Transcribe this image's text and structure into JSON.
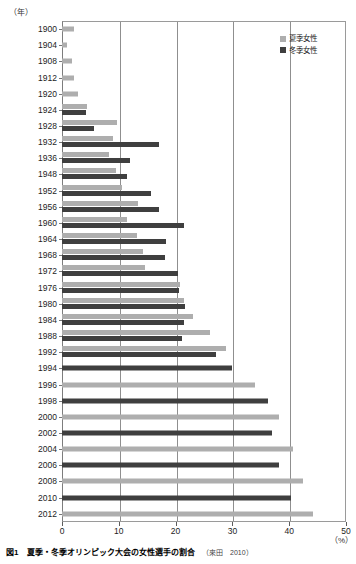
{
  "figure": {
    "caption_number": "図1",
    "caption_title": "夏季・冬季オリンピック大会の女性選手の割合",
    "caption_source": "（來田　2010）"
  },
  "axes": {
    "y_unit_label": "（年）",
    "x_unit_label": "（%）",
    "x_ticks": [
      "0",
      "10",
      "20",
      "30",
      "40",
      "50"
    ]
  },
  "legend": {
    "items": [
      {
        "label": "夏季女性",
        "color": "#aeaeae",
        "key": "summer"
      },
      {
        "label": "冬季女性",
        "color": "#3f3f3f",
        "key": "winter"
      }
    ]
  },
  "colors": {
    "summer": "#aeaeae",
    "winter": "#3f3f3f",
    "frame": "#9a9a9a",
    "grid": "#8f8f8f"
  },
  "chart_data": {
    "type": "bar",
    "orientation": "horizontal",
    "title": "夏季・冬季オリンピック大会の女性選手の割合",
    "xlabel": "（%）",
    "ylabel": "（年）",
    "xlim": [
      0,
      50
    ],
    "grid": true,
    "legend_position": "top-right",
    "categories": [
      "1900",
      "1904",
      "1908",
      "1912",
      "1920",
      "1924",
      "1928",
      "1932",
      "1936",
      "1948",
      "1952",
      "1956",
      "1960",
      "1964",
      "1968",
      "1972",
      "1976",
      "1980",
      "1984",
      "1988",
      "1992",
      "1994",
      "1996",
      "1998",
      "2000",
      "2002",
      "2004",
      "2006",
      "2008",
      "2010",
      "2012"
    ],
    "series": [
      {
        "name": "夏季女性",
        "color": "#aeaeae",
        "values": [
          2.2,
          0.9,
          1.8,
          2.2,
          2.9,
          4.4,
          9.6,
          9.0,
          8.3,
          9.5,
          10.5,
          13.3,
          11.4,
          13.2,
          14.2,
          14.6,
          20.7,
          21.5,
          23.0,
          26.1,
          28.9,
          null,
          34.0,
          null,
          38.2,
          null,
          40.7,
          null,
          42.4,
          null,
          44.2
        ]
      },
      {
        "name": "冬季女性",
        "color": "#3f3f3f",
        "values": [
          null,
          null,
          null,
          null,
          null,
          4.3,
          5.6,
          17.0,
          12.0,
          11.5,
          15.7,
          17.0,
          21.5,
          18.3,
          18.2,
          20.5,
          20.6,
          21.7,
          21.5,
          21.2,
          27.1,
          30.0,
          null,
          36.2,
          null,
          36.9,
          null,
          38.2,
          null,
          40.3,
          null
        ]
      }
    ]
  },
  "rows": [
    {
      "year": "1900",
      "summer": 2.2,
      "winter": null
    },
    {
      "year": "1904",
      "summer": 0.9,
      "winter": null
    },
    {
      "year": "1908",
      "summer": 1.8,
      "winter": null
    },
    {
      "year": "1912",
      "summer": 2.2,
      "winter": null
    },
    {
      "year": "1920",
      "summer": 2.9,
      "winter": null
    },
    {
      "year": "1924",
      "summer": 4.4,
      "winter": 4.3
    },
    {
      "year": "1928",
      "summer": 9.6,
      "winter": 5.6
    },
    {
      "year": "1932",
      "summer": 9.0,
      "winter": 17.0
    },
    {
      "year": "1936",
      "summer": 8.3,
      "winter": 12.0
    },
    {
      "year": "1948",
      "summer": 9.5,
      "winter": 11.5
    },
    {
      "year": "1952",
      "summer": 10.5,
      "winter": 15.7
    },
    {
      "year": "1956",
      "summer": 13.3,
      "winter": 17.0
    },
    {
      "year": "1960",
      "summer": 11.4,
      "winter": 21.5
    },
    {
      "year": "1964",
      "summer": 13.2,
      "winter": 18.3
    },
    {
      "year": "1968",
      "summer": 14.2,
      "winter": 18.2
    },
    {
      "year": "1972",
      "summer": 14.6,
      "winter": 20.5
    },
    {
      "year": "1976",
      "summer": 20.7,
      "winter": 20.6
    },
    {
      "year": "1980",
      "summer": 21.5,
      "winter": 21.7
    },
    {
      "year": "1984",
      "summer": 23.0,
      "winter": 21.5
    },
    {
      "year": "1988",
      "summer": 26.1,
      "winter": 21.2
    },
    {
      "year": "1992",
      "summer": 28.9,
      "winter": 27.1
    },
    {
      "year": "1994",
      "summer": null,
      "winter": 30.0
    },
    {
      "year": "1996",
      "summer": 34.0,
      "winter": null
    },
    {
      "year": "1998",
      "summer": null,
      "winter": 36.2
    },
    {
      "year": "2000",
      "summer": 38.2,
      "winter": null
    },
    {
      "year": "2002",
      "summer": null,
      "winter": 36.9
    },
    {
      "year": "2004",
      "summer": 40.7,
      "winter": null
    },
    {
      "year": "2006",
      "summer": null,
      "winter": 38.2
    },
    {
      "year": "2008",
      "summer": 42.4,
      "winter": null
    },
    {
      "year": "2010",
      "summer": null,
      "winter": 40.3
    },
    {
      "year": "2012",
      "summer": 44.2,
      "winter": null
    }
  ]
}
